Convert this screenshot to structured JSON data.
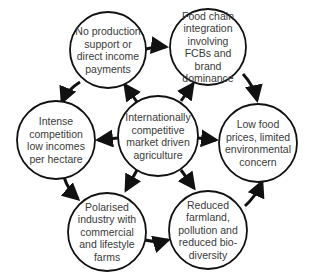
{
  "diagram": {
    "type": "cycle-with-hub",
    "hub": {
      "id": "center",
      "label": "Internationally competitive market driven agriculture"
    },
    "nodes": [
      {
        "id": "no-support",
        "label": "No production support or direct income payments"
      },
      {
        "id": "food-chain",
        "label": "Food chain integration involving FCBs and brand dominance"
      },
      {
        "id": "low-prices",
        "label": "Low food prices, limited environmental concern"
      },
      {
        "id": "reduced-farmland",
        "label": "Reduced farmland, pollution and reduced bio-diversity"
      },
      {
        "id": "polarised",
        "label": "Polarised industry with commercial and lifestyle farms"
      },
      {
        "id": "intense-competition",
        "label": "Intense competition low incomes per hectare"
      }
    ],
    "edges": [
      {
        "from": "center",
        "to": "no-support"
      },
      {
        "from": "center",
        "to": "food-chain"
      },
      {
        "from": "center",
        "to": "low-prices"
      },
      {
        "from": "center",
        "to": "reduced-farmland"
      },
      {
        "from": "center",
        "to": "polarised"
      },
      {
        "from": "center",
        "to": "intense-competition"
      },
      {
        "from": "no-support",
        "to": "food-chain"
      },
      {
        "from": "food-chain",
        "to": "low-prices"
      },
      {
        "from": "reduced-farmland",
        "to": "low-prices"
      },
      {
        "from": "polarised",
        "to": "reduced-farmland"
      },
      {
        "from": "intense-competition",
        "to": "polarised"
      },
      {
        "from": "no-support",
        "to": "intense-competition"
      }
    ],
    "colors": {
      "stroke": "#111111",
      "text": "#3a3a3a",
      "background": "#ffffff"
    }
  }
}
